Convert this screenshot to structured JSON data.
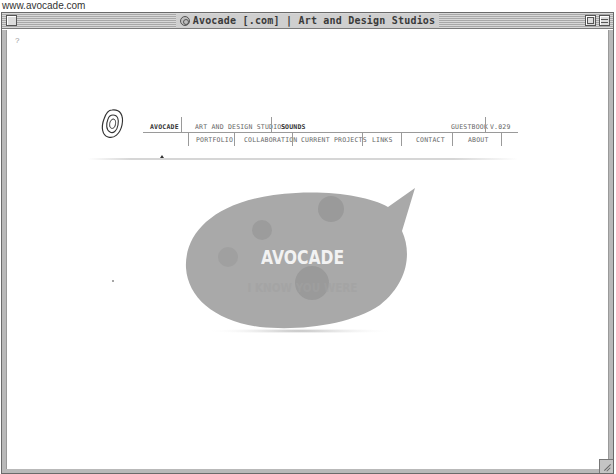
{
  "caption": {
    "url": "www.avocade.com"
  },
  "window": {
    "title": "Avocade [.com] | Art and Design Studios",
    "title_icon": "globe-icon",
    "controls": [
      "close-box",
      "zoom-box",
      "collapse-box"
    ]
  },
  "page": {
    "help_mark": "?",
    "nav": {
      "logo_icon": "spiral-logo-icon",
      "top_row": [
        {
          "label": "AVOCADE",
          "active": true
        },
        {
          "label": "ART AND DESIGN STUDIOS"
        },
        {
          "label": "SOUNDS"
        },
        {
          "label": "GUESTBOOK"
        },
        {
          "label": "V.029"
        }
      ],
      "bottom_row": [
        {
          "label": "PORTFOLIO"
        },
        {
          "label": "COLLABORATION"
        },
        {
          "label": "CURRENT PROJECTS"
        },
        {
          "label": "LINKS"
        },
        {
          "label": "CONTACT"
        },
        {
          "label": "ABOUT"
        }
      ]
    },
    "bubble": {
      "title": "AVOCADE",
      "subtitle": "I KNOW YOU WERE",
      "fill_color": "#a9a9a9",
      "spot_color": "#9a9a9a",
      "title_color": "#f2f2f2"
    }
  }
}
